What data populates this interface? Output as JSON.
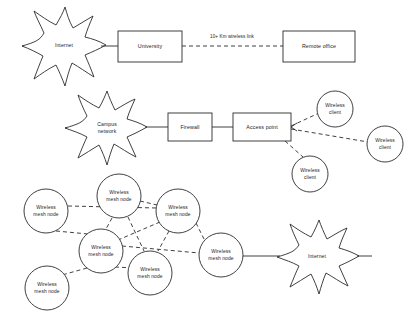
{
  "diagram": {
    "background_color": "#ffffff",
    "line_color": "#2b2b2b",
    "text_color": "#1d1d1d",
    "sections": [
      {
        "name": "point-to-point-wireless-link",
        "description": "Internet connected to University, linked over a long distance wireless hop to a Remote office"
      },
      {
        "name": "campus-wireless-access",
        "description": "Campus network behind a Firewall feeding an Access point that serves three Wireless clients"
      },
      {
        "name": "wireless-mesh-network",
        "description": "Six interconnected Wireless mesh nodes with one gateway node reaching the Internet"
      }
    ]
  },
  "nodes": {
    "internet_top": {
      "label": "Internet",
      "shape": "cloud-star",
      "cx": 64,
      "cy": 46,
      "rx": 42,
      "ry": 36
    },
    "university": {
      "label": "University",
      "shape": "rect",
      "x": 118,
      "y": 31,
      "w": 64,
      "h": 31
    },
    "remote_office": {
      "label": "Remote office",
      "shape": "rect",
      "x": 283,
      "y": 31,
      "w": 72,
      "h": 31
    },
    "campus_network": {
      "label": "Campus network",
      "shape": "cloud-star",
      "cx": 107,
      "cy": 128,
      "rx": 42,
      "ry": 34
    },
    "firewall": {
      "label": "Firewall",
      "shape": "rect",
      "x": 168,
      "y": 113,
      "w": 44,
      "h": 28
    },
    "access_point": {
      "label": "Access point",
      "shape": "rect",
      "x": 233,
      "y": 113,
      "w": 58,
      "h": 28
    },
    "wireless_client_1": {
      "label": "Wireless client",
      "shape": "circle",
      "cx": 335,
      "cy": 109,
      "r": 18
    },
    "wireless_client_2": {
      "label": "Wireless client",
      "shape": "circle",
      "cx": 385,
      "cy": 144,
      "r": 18
    },
    "wireless_client_3": {
      "label": "Wireless client",
      "shape": "circle",
      "cx": 310,
      "cy": 174,
      "r": 18
    },
    "mesh_node_1": {
      "label": "Wireless mesh node",
      "shape": "circle",
      "cx": 46,
      "cy": 211,
      "r": 22
    },
    "mesh_node_2": {
      "label": "Wireless mesh node",
      "shape": "circle",
      "cx": 119,
      "cy": 196,
      "r": 22
    },
    "mesh_node_3": {
      "label": "Wireless mesh node",
      "shape": "circle",
      "cx": 178,
      "cy": 211,
      "r": 22
    },
    "mesh_node_4": {
      "label": "Wireless mesh node",
      "shape": "circle",
      "cx": 101,
      "cy": 251,
      "r": 22
    },
    "mesh_node_5": {
      "label": "Wireless mesh node",
      "shape": "circle",
      "cx": 150,
      "cy": 273,
      "r": 22
    },
    "mesh_node_6": {
      "label": "Wireless mesh node",
      "shape": "circle",
      "cx": 221,
      "cy": 255,
      "r": 22
    },
    "mesh_node_7": {
      "label": "Wireless mesh node",
      "shape": "circle",
      "cx": 47,
      "cy": 288,
      "r": 22
    },
    "internet_bottom": {
      "label": "Internet",
      "shape": "cloud-star",
      "cx": 317,
      "cy": 257,
      "rx": 40,
      "ry": 34
    }
  },
  "edges": {
    "internet_to_university": {
      "style": "solid",
      "label": ""
    },
    "university_to_remote_office": {
      "style": "dashed",
      "label": "10+ Km wireless link"
    },
    "campus_to_firewall": {
      "style": "solid",
      "label": ""
    },
    "firewall_to_access_point": {
      "style": "solid",
      "label": ""
    },
    "access_point_to_client_1": {
      "style": "dashed",
      "label": ""
    },
    "access_point_to_client_2": {
      "style": "dashed",
      "label": ""
    },
    "access_point_to_client_3": {
      "style": "dashed",
      "label": ""
    },
    "mesh_1_to_mesh_3": {
      "style": "dashed",
      "label": ""
    },
    "mesh_1_to_mesh_4": {
      "style": "dashed",
      "label": ""
    },
    "mesh_2_to_mesh_3": {
      "style": "dashed",
      "label": ""
    },
    "mesh_2_to_mesh_4": {
      "style": "dashed",
      "label": ""
    },
    "mesh_2_to_mesh_5": {
      "style": "dashed",
      "label": ""
    },
    "mesh_3_to_mesh_4": {
      "style": "dashed",
      "label": ""
    },
    "mesh_3_to_mesh_5": {
      "style": "dashed",
      "label": ""
    },
    "mesh_3_to_mesh_6": {
      "style": "dashed",
      "label": ""
    },
    "mesh_4_to_mesh_5": {
      "style": "dashed",
      "label": ""
    },
    "mesh_4_to_mesh_7": {
      "style": "dashed",
      "label": ""
    },
    "mesh_4_to_mesh_6": {
      "style": "dashed",
      "label": ""
    },
    "mesh_6_to_internet": {
      "style": "solid",
      "label": ""
    }
  }
}
